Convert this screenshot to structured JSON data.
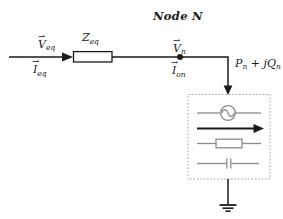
{
  "diagram": {
    "title": "Node N",
    "vector_arrow": "→",
    "labels": {
      "v_eq": {
        "base": "V",
        "sub": "eq"
      },
      "i_eq": {
        "base": "I",
        "sub": "eq"
      },
      "z_eq": {
        "base": "Z",
        "sub": "eq"
      },
      "v_n": {
        "base": "V",
        "sub": "n"
      },
      "i_on": {
        "base": "I",
        "sub": "on"
      },
      "power": {
        "p": "P",
        "p_sub": "n",
        "plus": " + ",
        "jq": "jQ",
        "q_sub": "n"
      }
    },
    "icons": {
      "ac_source": "ac-source-icon",
      "current_arrow": "current-arrow-icon",
      "resistor": "resistor-icon",
      "capacitor": "capacitor-icon",
      "ground": "ground-icon"
    },
    "colors": {
      "wire": "#1a1a1a",
      "component": "#8c8c8c",
      "box_border": "#a3a3a3",
      "background": "#ffffff"
    }
  }
}
